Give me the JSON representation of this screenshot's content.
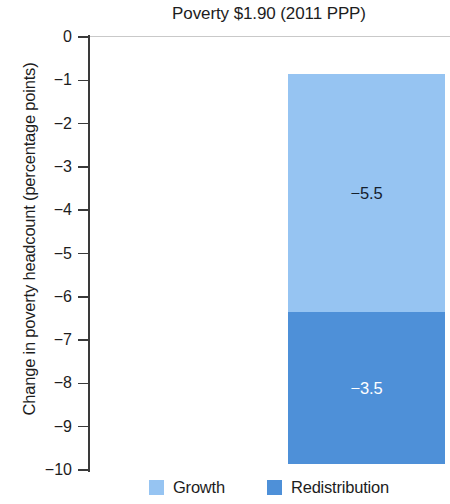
{
  "chart_data": {
    "type": "bar",
    "subtype": "stacked-bar-single-category",
    "title": "Poverty $1.90 (2011 PPP)",
    "xlabel": "",
    "ylabel": "Change in poverty headcount (percentage points)",
    "ylim": [
      -10,
      0
    ],
    "ytick_labels": [
      "0",
      "−1",
      "−2",
      "−3",
      "−4",
      "−5",
      "−6",
      "−7",
      "−8",
      "−9",
      "−10"
    ],
    "ytick_values": [
      0,
      -1,
      -2,
      -3,
      -4,
      -5,
      -6,
      -7,
      -8,
      -9,
      -10
    ],
    "categories": [
      ""
    ],
    "grid": false,
    "legend_position": "bottom",
    "series": [
      {
        "name": "Growth",
        "color": "#96c4f2",
        "values": [
          -5.5
        ],
        "data_label": "−5.5",
        "label_color": "#14202e"
      },
      {
        "name": "Redistribution",
        "color": "#4e90d8",
        "values": [
          -3.5
        ],
        "data_label": "−3.5",
        "label_color": "#ffffff"
      }
    ],
    "stack_total": -9.0,
    "segment_boundaries": [
      0,
      -5.5,
      -9.0
    ]
  },
  "title": "Poverty $1.90 (2011 PPP)",
  "y_axis": {
    "label": "Change in poverty headcount (percentage points)",
    "ticks": [
      {
        "label": "0"
      },
      {
        "label": "−1"
      },
      {
        "label": "−2"
      },
      {
        "label": "−3"
      },
      {
        "label": "−4"
      },
      {
        "label": "−5"
      },
      {
        "label": "−6"
      },
      {
        "label": "−7"
      },
      {
        "label": "−8"
      },
      {
        "label": "−9"
      },
      {
        "label": "−10"
      }
    ]
  },
  "bar": {
    "growth": {
      "value_label": "−5.5"
    },
    "redistribution": {
      "value_label": "−3.5"
    }
  },
  "legend": {
    "items": [
      {
        "label": "Growth"
      },
      {
        "label": "Redistribution"
      }
    ]
  }
}
